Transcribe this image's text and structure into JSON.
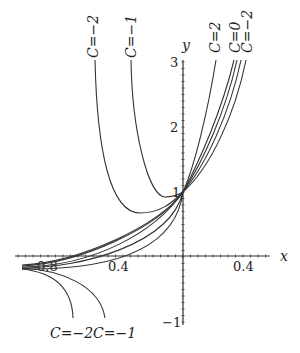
{
  "chart_data": {
    "type": "line",
    "title": "",
    "xlabel": "x",
    "ylabel": "y",
    "xlim": [
      -1.1,
      0.5
    ],
    "ylim": [
      -1,
      3
    ],
    "grid": false,
    "x_tick_labels": [
      "0.8",
      "0.4",
      "0.4"
    ],
    "x_ticks": [
      -0.8,
      -0.4,
      0.4
    ],
    "y_tick_labels": [
      "3",
      "2",
      "1",
      "−1"
    ],
    "y_ticks": [
      3,
      2,
      1,
      -1
    ],
    "common_point": {
      "x": 0,
      "y": 1
    },
    "series": [
      {
        "name": "C=2",
        "label_position": "top",
        "path": "M183,192 C195,165 208,110 216,60"
      },
      {
        "name": "C=1",
        "label_position": "top",
        "path": "M183,192 C200,160 222,110 234,60"
      },
      {
        "name": "C=0",
        "label_position": "top",
        "path": "M183,192 C203,162 226,110 237,60"
      },
      {
        "name": "C=-1",
        "label_position": "top",
        "path": "M183,192 C206,165 230,112 241,60"
      },
      {
        "name": "C=-2",
        "label_position": "top",
        "path": "M183,192 C210,168 235,115 246,60"
      },
      {
        "name": "C=-2",
        "label_position": "top-left",
        "path": "M95,60 C97,150 110,213 140,213 C160,213 172,203 183,192"
      },
      {
        "name": "C=-1",
        "label_position": "top-left",
        "path": "M131,60 C132,130 148,196 165,197 C173,197 178,195 183,192"
      },
      {
        "name": "C=2 (left tail)",
        "path": "M183,192 C160,225 80,262 22,265"
      },
      {
        "name": "C=1 (left tail)",
        "path": "M183,192 C158,228 80,263 22,266"
      },
      {
        "name": "C=0 (left tail)",
        "path": "M183,192 C155,232 95,266 22,267"
      },
      {
        "name": "C=-1 (left tail, below)",
        "path": "M183,192 C170,245 80,268 22,268"
      },
      {
        "name": "C=-2 (left tail, below)",
        "path": "M183,192 C175,255 100,270 22,269"
      },
      {
        "name": "C=-2",
        "label_position": "bottom",
        "path": "M22,269 C50,272 72,285 73,318"
      },
      {
        "name": "C=-1",
        "label_position": "bottom",
        "path": "M22,268 C60,270 100,285 105,318"
      }
    ],
    "labels": {
      "top": [
        {
          "text": "C=−2",
          "x": 93,
          "y": 60
        },
        {
          "text": "C=−1",
          "x": 131,
          "y": 60
        },
        {
          "text": "C=2",
          "x": 215,
          "y": 55
        },
        {
          "text": "C=0",
          "x": 235,
          "y": 55
        },
        {
          "text": "C=−2",
          "x": 247,
          "y": 55
        }
      ],
      "bottom": [
        {
          "text": "C=−2",
          "x": 72,
          "y": 338
        },
        {
          "text": "C=−1",
          "x": 115,
          "y": 338
        }
      ]
    }
  },
  "axes": {
    "x_label": "x",
    "y_label": "y",
    "x_ticks": [
      {
        "label": "0.8",
        "x": 48
      },
      {
        "label": "0.4",
        "x": 118
      },
      {
        "label": "0.4",
        "x": 243
      }
    ],
    "y_ticks": [
      {
        "label": "3",
        "y": 62
      },
      {
        "label": "2",
        "y": 127
      },
      {
        "label": "1",
        "y": 192
      },
      {
        "label": "−1",
        "y": 322
      }
    ]
  }
}
